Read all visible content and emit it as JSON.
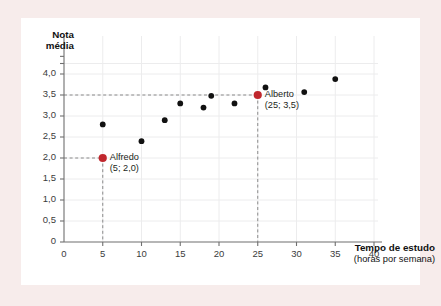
{
  "figure": {
    "background_color": "#f7eceb",
    "card_color": "#ffffff"
  },
  "chart_data": {
    "type": "scatter",
    "title": "",
    "xlabel": "Tempo de estudo",
    "xlabel_sub": "(horas por semana)",
    "ylabel": "Nota média",
    "ylabel_line1": "Nota",
    "ylabel_line2": "média",
    "xlim": [
      0,
      41.5
    ],
    "ylim": [
      0,
      4.45
    ],
    "xticks": [
      0,
      5,
      10,
      15,
      20,
      25,
      30,
      35,
      40
    ],
    "xticklabels": [
      "0",
      "5",
      "10",
      "15",
      "20",
      "25",
      "30",
      "35",
      "40"
    ],
    "yticks": [
      0,
      0.5,
      1.0,
      1.5,
      2.0,
      2.5,
      3.0,
      3.5,
      4.0
    ],
    "yticklabels": [
      "0",
      "0,5",
      "1,0",
      "1,5",
      "2,0",
      "2,5",
      "3,0",
      "3,5",
      "4,0"
    ],
    "grid": true,
    "grid_color": "#ececed",
    "legend": "none",
    "point_color": "#111111",
    "highlight_color": "#c0272d",
    "guide_color": "#8a8a8a",
    "x": [
      5,
      5,
      10,
      13,
      15,
      18,
      19,
      22,
      25,
      26,
      31,
      35
    ],
    "y": [
      2.0,
      2.8,
      2.4,
      2.9,
      3.3,
      3.2,
      3.48,
      3.3,
      3.5,
      3.68,
      3.57,
      3.88
    ],
    "points": [
      {
        "x": 5,
        "y": 2.0,
        "highlighted": true,
        "label": "Alfredo",
        "coords": "(5; 2,0)"
      },
      {
        "x": 5,
        "y": 2.8,
        "highlighted": false
      },
      {
        "x": 10,
        "y": 2.4,
        "highlighted": false
      },
      {
        "x": 13,
        "y": 2.9,
        "highlighted": false
      },
      {
        "x": 15,
        "y": 3.3,
        "highlighted": false
      },
      {
        "x": 18,
        "y": 3.2,
        "highlighted": false
      },
      {
        "x": 19,
        "y": 3.48,
        "highlighted": false
      },
      {
        "x": 22,
        "y": 3.3,
        "highlighted": false
      },
      {
        "x": 25,
        "y": 3.5,
        "highlighted": true,
        "label": "Alberto",
        "coords": "(25; 3,5)"
      },
      {
        "x": 26,
        "y": 3.68,
        "highlighted": false
      },
      {
        "x": 31,
        "y": 3.57,
        "highlighted": false
      },
      {
        "x": 35,
        "y": 3.88,
        "highlighted": false
      }
    ],
    "annotations": [
      {
        "name": "alfredo",
        "label": "Alfredo",
        "coords": "(5; 2,0)",
        "x": 5,
        "y": 2.0
      },
      {
        "name": "alberto",
        "label": "Alberto",
        "coords": "(25; 3,5)",
        "x": 25,
        "y": 3.5
      }
    ],
    "guides": [
      {
        "name": "alfredo-guide",
        "x": 5,
        "y": 2.0
      },
      {
        "name": "alberto-guide",
        "x": 25,
        "y": 3.5
      }
    ]
  }
}
